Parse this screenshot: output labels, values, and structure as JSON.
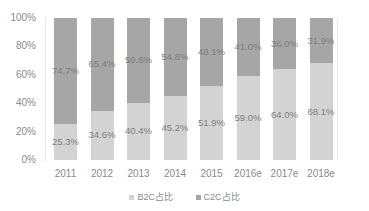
{
  "chart_data": {
    "type": "bar",
    "stacked": true,
    "percent_stacked": true,
    "title": "",
    "xlabel": "",
    "ylabel": "",
    "ylim": [
      0,
      100
    ],
    "yticks": [
      "0%",
      "20%",
      "40%",
      "60%",
      "80%",
      "100%"
    ],
    "categories": [
      "2011",
      "2012",
      "2013",
      "2014",
      "2015",
      "2016e",
      "2017e",
      "2018e"
    ],
    "series": [
      {
        "name": "B2C占比",
        "color": "#d3d3d3",
        "values": [
          25.3,
          34.6,
          40.4,
          45.2,
          51.9,
          59.0,
          64.0,
          68.1
        ],
        "labels": [
          "25.3%",
          "34.6%",
          "40.4%",
          "45.2%",
          "51.9%",
          "59.0%",
          "64.0%",
          "68.1%"
        ]
      },
      {
        "name": "C2C占比",
        "color": "#a6a6a6",
        "values": [
          74.7,
          65.4,
          59.6,
          54.8,
          48.1,
          41.0,
          36.0,
          31.9
        ],
        "labels": [
          "74.7%",
          "65.4%",
          "59.6%",
          "54.8%",
          "48.1%",
          "41.0%",
          "36.0%",
          "31.9%"
        ]
      }
    ],
    "grid": false,
    "legend_position": "bottom"
  },
  "legend": {
    "b2c": "B2C占比",
    "c2c": "C2C占比"
  }
}
